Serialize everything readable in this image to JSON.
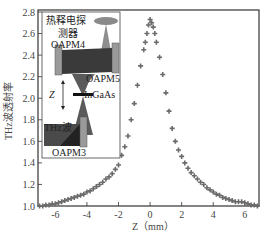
{
  "chart_data": {
    "type": "scatter",
    "title": "",
    "xlabel": "Z（mm）",
    "ylabel": "THz波透射率",
    "xlim": [
      -7.1,
      6.9
    ],
    "ylim": [
      1.0,
      2.8
    ],
    "xticks": [
      -6,
      -4,
      -2,
      0,
      2,
      4,
      6
    ],
    "yticks": [
      1.0,
      1.2,
      1.4,
      1.6,
      1.8,
      2.0,
      2.2,
      2.4,
      2.6,
      2.8
    ],
    "grid": false,
    "legend": null,
    "marker": "plus",
    "marker_color": "#6b6b6b",
    "series": [
      {
        "name": "THz transmittance",
        "x": [
          -7.0,
          -6.8,
          -6.6,
          -6.4,
          -6.2,
          -6.0,
          -5.8,
          -5.6,
          -5.4,
          -5.2,
          -5.0,
          -4.8,
          -4.6,
          -4.4,
          -4.2,
          -4.0,
          -3.8,
          -3.6,
          -3.4,
          -3.2,
          -3.0,
          -2.8,
          -2.6,
          -2.4,
          -2.2,
          -2.0,
          -1.8,
          -1.6,
          -1.4,
          -1.2,
          -1.0,
          -0.8,
          -0.6,
          -0.4,
          -0.3,
          -0.2,
          -0.1,
          0.0,
          0.1,
          0.2,
          0.3,
          0.4,
          0.6,
          0.8,
          1.0,
          1.2,
          1.4,
          1.6,
          1.8,
          2.0,
          2.2,
          2.4,
          2.6,
          2.8,
          3.0,
          3.2,
          3.4,
          3.6,
          3.8,
          4.0,
          4.2,
          4.4,
          4.6,
          4.8,
          5.0,
          5.2,
          5.4,
          5.6,
          5.8,
          6.0,
          6.2,
          6.4,
          6.6,
          6.8
        ],
        "y": [
          1.0,
          1.0,
          1.01,
          1.01,
          1.02,
          1.02,
          1.03,
          1.04,
          1.05,
          1.06,
          1.07,
          1.08,
          1.09,
          1.1,
          1.11,
          1.13,
          1.14,
          1.16,
          1.18,
          1.2,
          1.22,
          1.25,
          1.27,
          1.3,
          1.34,
          1.38,
          1.47,
          1.55,
          1.65,
          1.8,
          1.95,
          2.12,
          2.3,
          2.45,
          2.52,
          2.6,
          2.68,
          2.73,
          2.7,
          2.66,
          2.6,
          2.52,
          2.38,
          2.22,
          2.05,
          1.88,
          1.72,
          1.6,
          1.52,
          1.46,
          1.4,
          1.35,
          1.31,
          1.28,
          1.25,
          1.22,
          1.2,
          1.17,
          1.15,
          1.13,
          1.11,
          1.1,
          1.08,
          1.07,
          1.06,
          1.05,
          1.04,
          1.04,
          1.04,
          1.03,
          1.02,
          1.01,
          1.01,
          1.0
        ]
      }
    ],
    "inset": {
      "description": "Z-scan optical setup schematic",
      "labels": [
        "热释电探测器",
        "OAPM4",
        "OAPM5",
        "Z",
        "InGaAs",
        "THz波",
        "OAPM3"
      ]
    }
  },
  "axes": {
    "xlabel": "Z（mm）",
    "ylabel": "THz波透射率",
    "xtick_labels": [
      "-6",
      "-4",
      "-2",
      "0",
      "2",
      "4",
      "6"
    ],
    "ytick_labels": [
      "1.0",
      "1.2",
      "1.4",
      "1.6",
      "1.8",
      "2.0",
      "2.2",
      "2.4",
      "2.6",
      "2.8"
    ]
  },
  "inset": {
    "detector_line1": "热释电探",
    "detector_line2": "测器",
    "oapm4": "OAPM4",
    "oapm5": "OAPM5",
    "z_label": "Z",
    "sample": "InGaAs",
    "thz": "THz波",
    "oapm3": "OAPM3"
  }
}
